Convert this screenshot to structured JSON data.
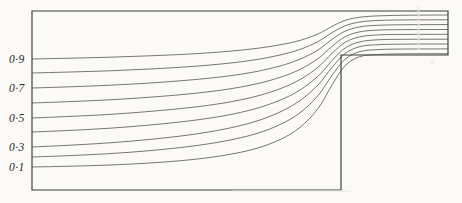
{
  "figure": {
    "background_color": "#fbfaf7",
    "line_color": "#4a4a4a",
    "wall_color": "#3a3a3a",
    "label_color": "#2a2a2a"
  },
  "geometry": {
    "domain_left": 32,
    "domain_right": 448,
    "domain_top": 11,
    "domain_bottom": 190,
    "step_x": 341,
    "step_y": 55,
    "inlet_height": 179,
    "outlet_height": 44
  },
  "axis_labels": [
    {
      "text": "0·9",
      "value": 0.9,
      "x": 9,
      "y": 59
    },
    {
      "text": "0·7",
      "value": 0.7,
      "x": 9,
      "y": 88
    },
    {
      "text": "0·5",
      "value": 0.5,
      "x": 9,
      "y": 118
    },
    {
      "text": "0·3",
      "value": 0.3,
      "x": 9,
      "y": 147
    },
    {
      "text": "0·1",
      "value": 0.1,
      "x": 9,
      "y": 167
    }
  ],
  "chart_data": {
    "type": "line",
    "xlabel": "",
    "ylabel": "",
    "xlim": [
      32,
      448
    ],
    "ylim": [
      190,
      11
    ],
    "grid": false,
    "legend": "none",
    "annotations": [
      "0·9",
      "0·7",
      "0·5",
      "0·3",
      "0·1"
    ],
    "series": [
      {
        "name": "0·9",
        "value": 0.9,
        "inlet_y": 59,
        "outlet_y": 15,
        "points": [
          [
            32,
            59
          ],
          [
            70,
            58.2
          ],
          [
            110,
            57.2
          ],
          [
            150,
            55.8
          ],
          [
            190,
            54.0
          ],
          [
            225,
            51.6
          ],
          [
            255,
            48.6
          ],
          [
            280,
            44.8
          ],
          [
            300,
            40.4
          ],
          [
            318,
            34.0
          ],
          [
            332,
            26.4
          ],
          [
            345,
            20.4
          ],
          [
            360,
            17.2
          ],
          [
            380,
            15.8
          ],
          [
            410,
            15.2
          ],
          [
            448,
            15.0
          ]
        ]
      },
      {
        "name": "0·8",
        "value": 0.8,
        "inlet_y": 73,
        "outlet_y": 19.9,
        "points": [
          [
            32,
            73
          ],
          [
            70,
            72.0
          ],
          [
            110,
            70.8
          ],
          [
            150,
            69.0
          ],
          [
            190,
            66.6
          ],
          [
            225,
            63.6
          ],
          [
            255,
            59.8
          ],
          [
            280,
            55.0
          ],
          [
            300,
            49.4
          ],
          [
            318,
            41.6
          ],
          [
            332,
            32.6
          ],
          [
            345,
            25.8
          ],
          [
            360,
            22.0
          ],
          [
            380,
            20.4
          ],
          [
            410,
            19.9
          ],
          [
            448,
            19.8
          ]
        ]
      },
      {
        "name": "0·7",
        "value": 0.7,
        "inlet_y": 88,
        "outlet_y": 24.7,
        "points": [
          [
            32,
            88
          ],
          [
            70,
            86.8
          ],
          [
            110,
            85.2
          ],
          [
            150,
            83.0
          ],
          [
            190,
            80.0
          ],
          [
            225,
            76.4
          ],
          [
            255,
            71.8
          ],
          [
            280,
            66.0
          ],
          [
            300,
            59.2
          ],
          [
            318,
            50.0
          ],
          [
            332,
            39.4
          ],
          [
            345,
            31.2
          ],
          [
            360,
            26.8
          ],
          [
            380,
            25.2
          ],
          [
            410,
            24.7
          ],
          [
            448,
            24.6
          ]
        ]
      },
      {
        "name": "0·6",
        "value": 0.6,
        "inlet_y": 103,
        "outlet_y": 29.6,
        "points": [
          [
            32,
            103
          ],
          [
            70,
            101.6
          ],
          [
            110,
            99.8
          ],
          [
            150,
            97.2
          ],
          [
            190,
            93.8
          ],
          [
            225,
            89.6
          ],
          [
            255,
            84.2
          ],
          [
            280,
            77.4
          ],
          [
            300,
            69.4
          ],
          [
            318,
            58.6
          ],
          [
            332,
            46.4
          ],
          [
            345,
            36.8
          ],
          [
            360,
            31.8
          ],
          [
            380,
            30.0
          ],
          [
            410,
            29.6
          ],
          [
            448,
            29.5
          ]
        ]
      },
      {
        "name": "0·5",
        "value": 0.5,
        "inlet_y": 118,
        "outlet_y": 34.4,
        "points": [
          [
            32,
            118
          ],
          [
            70,
            116.4
          ],
          [
            110,
            114.4
          ],
          [
            150,
            111.4
          ],
          [
            190,
            107.6
          ],
          [
            225,
            102.8
          ],
          [
            255,
            96.6
          ],
          [
            280,
            88.8
          ],
          [
            300,
            79.6
          ],
          [
            318,
            67.2
          ],
          [
            332,
            53.4
          ],
          [
            345,
            42.4
          ],
          [
            360,
            36.8
          ],
          [
            380,
            34.8
          ],
          [
            410,
            34.4
          ],
          [
            448,
            34.3
          ]
        ]
      },
      {
        "name": "0·4",
        "value": 0.4,
        "inlet_y": 132,
        "outlet_y": 39.3,
        "points": [
          [
            32,
            132
          ],
          [
            70,
            130.4
          ],
          [
            110,
            128.2
          ],
          [
            150,
            125.0
          ],
          [
            190,
            120.8
          ],
          [
            225,
            115.6
          ],
          [
            255,
            108.8
          ],
          [
            280,
            100.2
          ],
          [
            300,
            90.0
          ],
          [
            318,
            76.2
          ],
          [
            332,
            60.6
          ],
          [
            345,
            48.2
          ],
          [
            360,
            41.8
          ],
          [
            380,
            39.7
          ],
          [
            410,
            39.3
          ],
          [
            448,
            39.2
          ]
        ]
      },
      {
        "name": "0·3",
        "value": 0.3,
        "inlet_y": 147,
        "outlet_y": 44.1,
        "points": [
          [
            32,
            147
          ],
          [
            70,
            145.2
          ],
          [
            110,
            142.8
          ],
          [
            150,
            139.4
          ],
          [
            190,
            134.8
          ],
          [
            225,
            129.0
          ],
          [
            255,
            121.6
          ],
          [
            280,
            112.0
          ],
          [
            300,
            100.6
          ],
          [
            318,
            85.0
          ],
          [
            332,
            67.4
          ],
          [
            345,
            53.6
          ],
          [
            360,
            46.6
          ],
          [
            380,
            44.6
          ],
          [
            410,
            44.1
          ],
          [
            448,
            44.0
          ]
        ]
      },
      {
        "name": "0·2",
        "value": 0.2,
        "inlet_y": 157,
        "outlet_y": 49.0,
        "points": [
          [
            32,
            157
          ],
          [
            70,
            155.6
          ],
          [
            110,
            153.6
          ],
          [
            150,
            150.6
          ],
          [
            190,
            146.4
          ],
          [
            225,
            141.0
          ],
          [
            255,
            134.0
          ],
          [
            280,
            124.6
          ],
          [
            300,
            112.8
          ],
          [
            318,
            95.6
          ],
          [
            332,
            75.4
          ],
          [
            345,
            59.4
          ],
          [
            360,
            51.6
          ],
          [
            380,
            49.5
          ],
          [
            410,
            49.0
          ],
          [
            448,
            48.9
          ]
        ]
      },
      {
        "name": "0·1",
        "value": 0.1,
        "inlet_y": 167,
        "outlet_y": 53.8,
        "points": [
          [
            32,
            167
          ],
          [
            70,
            166.2
          ],
          [
            110,
            165.0
          ],
          [
            150,
            163.0
          ],
          [
            190,
            159.8
          ],
          [
            225,
            155.2
          ],
          [
            255,
            148.8
          ],
          [
            280,
            139.6
          ],
          [
            300,
            127.4
          ],
          [
            318,
            108.6
          ],
          [
            332,
            85.0
          ],
          [
            345,
            65.8
          ],
          [
            360,
            56.6
          ],
          [
            380,
            54.4
          ],
          [
            410,
            53.8
          ],
          [
            448,
            53.7
          ]
        ]
      }
    ]
  }
}
